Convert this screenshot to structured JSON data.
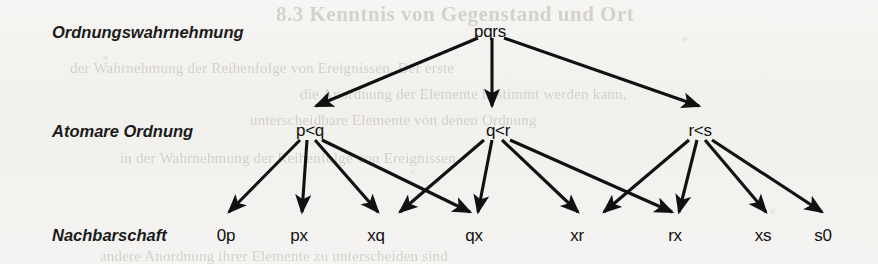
{
  "page": {
    "width": 878,
    "height": 264,
    "background_color": "#f3f2f0",
    "ink_color": "#111111"
  },
  "ghost_text": {
    "heading": "8.3  Kenntnis von Gegenstand und Ort",
    "line1": "der Wahrnehmung der Reihenfolge von Ereignissen. Der erste",
    "line2": "die Anordnung der Elemente bestimmt werden kann,",
    "line3": "unterscheidbare Elemente von denen Ordnung",
    "line4": "in der Wahrnehmung der Reihenfolge von Ereignissen",
    "line5": "andere Anordnung ihrer Elemente zu unterscheiden sind"
  },
  "diagram": {
    "type": "tree",
    "row_labels": [
      {
        "id": "row-1",
        "text": "Ordnungswahrnehmung",
        "x": 52,
        "y": 23
      },
      {
        "id": "row-2",
        "text": "Atomare Ordnung",
        "x": 52,
        "y": 122
      },
      {
        "id": "row-3",
        "text": "Nachbarschaft",
        "x": 52,
        "y": 226
      }
    ],
    "levels": [
      {
        "id": "level-perception",
        "label": "Ordnungswahrnehmung",
        "nodes": [
          {
            "id": "pqrs",
            "text": "pqrs",
            "x": 490,
            "y": 22
          }
        ]
      },
      {
        "id": "level-atomic-order",
        "label": "Atomare Ordnung",
        "nodes": [
          {
            "id": "p-lt-q",
            "text": "p<q",
            "x": 310,
            "y": 121
          },
          {
            "id": "q-lt-r",
            "text": "q<r",
            "x": 498,
            "y": 121
          },
          {
            "id": "r-lt-s",
            "text": "r<s",
            "x": 700,
            "y": 121
          }
        ]
      },
      {
        "id": "level-neighbourhood",
        "label": "Nachbarschaft",
        "nodes": [
          {
            "id": "0p",
            "text": "0p",
            "x": 226,
            "y": 226
          },
          {
            "id": "px",
            "text": "px",
            "x": 299,
            "y": 226
          },
          {
            "id": "xq",
            "text": "xq",
            "x": 376,
            "y": 226
          },
          {
            "id": "qx",
            "text": "qx",
            "x": 474,
            "y": 226
          },
          {
            "id": "xr",
            "text": "xr",
            "x": 577,
            "y": 226
          },
          {
            "id": "rx",
            "text": "rx",
            "x": 675,
            "y": 226
          },
          {
            "id": "xs",
            "text": "xs",
            "x": 763,
            "y": 226
          },
          {
            "id": "s0",
            "text": "s0",
            "x": 823,
            "y": 226
          }
        ]
      }
    ],
    "edges": [
      {
        "id": "e-pqrs-pq",
        "from": "pqrs",
        "to": "p-lt-q",
        "x1": 478,
        "y1": 38,
        "x2": 316,
        "y2": 106
      },
      {
        "id": "e-pqrs-qr",
        "from": "pqrs",
        "to": "q-lt-r",
        "x1": 492,
        "y1": 38,
        "x2": 492,
        "y2": 106
      },
      {
        "id": "e-pqrs-rs",
        "from": "pqrs",
        "to": "r-lt-s",
        "x1": 504,
        "y1": 38,
        "x2": 699,
        "y2": 106
      },
      {
        "id": "e-pq-0p",
        "from": "p-lt-q",
        "to": "0p",
        "x1": 300,
        "y1": 140,
        "x2": 229,
        "y2": 212
      },
      {
        "id": "e-pq-px",
        "from": "p-lt-q",
        "to": "px",
        "x1": 307,
        "y1": 140,
        "x2": 302,
        "y2": 212
      },
      {
        "id": "e-pq-xq",
        "from": "p-lt-q",
        "to": "xq",
        "x1": 315,
        "y1": 140,
        "x2": 378,
        "y2": 212
      },
      {
        "id": "e-pq-qx",
        "from": "p-lt-q",
        "to": "qx",
        "x1": 322,
        "y1": 140,
        "x2": 470,
        "y2": 212
      },
      {
        "id": "e-qr-xq",
        "from": "q-lt-r",
        "to": "xq",
        "x1": 484,
        "y1": 140,
        "x2": 400,
        "y2": 212
      },
      {
        "id": "e-qr-qx",
        "from": "q-lt-r",
        "to": "qx",
        "x1": 492,
        "y1": 140,
        "x2": 478,
        "y2": 212
      },
      {
        "id": "e-qr-xr",
        "from": "q-lt-r",
        "to": "xr",
        "x1": 502,
        "y1": 140,
        "x2": 578,
        "y2": 212
      },
      {
        "id": "e-qr-rx",
        "from": "q-lt-r",
        "to": "rx",
        "x1": 510,
        "y1": 140,
        "x2": 672,
        "y2": 212
      },
      {
        "id": "e-rs-xr",
        "from": "r-lt-s",
        "to": "xr",
        "x1": 689,
        "y1": 140,
        "x2": 604,
        "y2": 212
      },
      {
        "id": "e-rs-rx",
        "from": "r-lt-s",
        "to": "rx",
        "x1": 697,
        "y1": 140,
        "x2": 679,
        "y2": 212
      },
      {
        "id": "e-rs-xs",
        "from": "r-lt-s",
        "to": "xs",
        "x1": 705,
        "y1": 140,
        "x2": 766,
        "y2": 212
      },
      {
        "id": "e-rs-s0",
        "from": "r-lt-s",
        "to": "s0",
        "x1": 712,
        "y1": 140,
        "x2": 822,
        "y2": 212
      }
    ]
  }
}
